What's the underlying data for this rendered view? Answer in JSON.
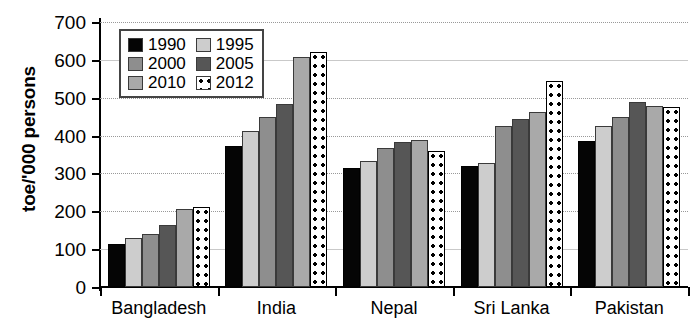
{
  "chart_data": {
    "type": "bar",
    "title": "",
    "xlabel": "",
    "ylabel": "toe/'000 persons",
    "ylim": [
      0,
      700
    ],
    "yticks": [
      0,
      100,
      200,
      300,
      400,
      500,
      600,
      700
    ],
    "grid": true,
    "legend_position": "upper-left-inside",
    "categories": [
      "Bangladesh",
      "India",
      "Nepal",
      "Sri Lanka",
      "Pakistan"
    ],
    "series": [
      {
        "name": "1990",
        "color": "#050505",
        "values": [
          113,
          373,
          315,
          320,
          385
        ]
      },
      {
        "name": "1995",
        "color": "#cdcdcd",
        "values": [
          130,
          412,
          333,
          327,
          425
        ]
      },
      {
        "name": "2000",
        "color": "#8e8e8e",
        "values": [
          140,
          448,
          368,
          425,
          450
        ]
      },
      {
        "name": "2005",
        "color": "#565656",
        "values": [
          163,
          483,
          382,
          445,
          488
        ]
      },
      {
        "name": "2010",
        "color": "#a9a9a9",
        "values": [
          205,
          607,
          388,
          463,
          478
        ]
      },
      {
        "name": "2012",
        "color": "#ffffff",
        "values": [
          212,
          622,
          360,
          545,
          475
        ]
      }
    ]
  },
  "legend": {
    "entries": [
      {
        "label": "1990",
        "swatch": "swatch-1990"
      },
      {
        "label": "1995",
        "swatch": "swatch-1995"
      },
      {
        "label": "2000",
        "swatch": "swatch-2000"
      },
      {
        "label": "2005",
        "swatch": "swatch-2005"
      },
      {
        "label": "2010",
        "swatch": "swatch-2010"
      },
      {
        "label": "2012",
        "swatch": "swatch-2012"
      }
    ]
  },
  "axis": {
    "y_title": "toe/'000 persons",
    "y_tick_labels": [
      "700",
      "600",
      "500",
      "400",
      "300",
      "200",
      "100",
      "0"
    ],
    "x_tick_labels": [
      "Bangladesh",
      "India",
      "Nepal",
      "Sri Lanka",
      "Pakistan"
    ]
  }
}
